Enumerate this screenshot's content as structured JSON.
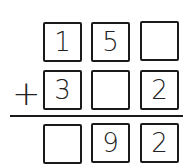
{
  "problem": {
    "operator": "+",
    "rows": [
      {
        "cells": [
          "1",
          "5",
          ""
        ]
      },
      {
        "cells": [
          "3",
          "",
          "2"
        ]
      },
      {
        "cells": [
          "",
          "9",
          "2"
        ]
      }
    ]
  }
}
